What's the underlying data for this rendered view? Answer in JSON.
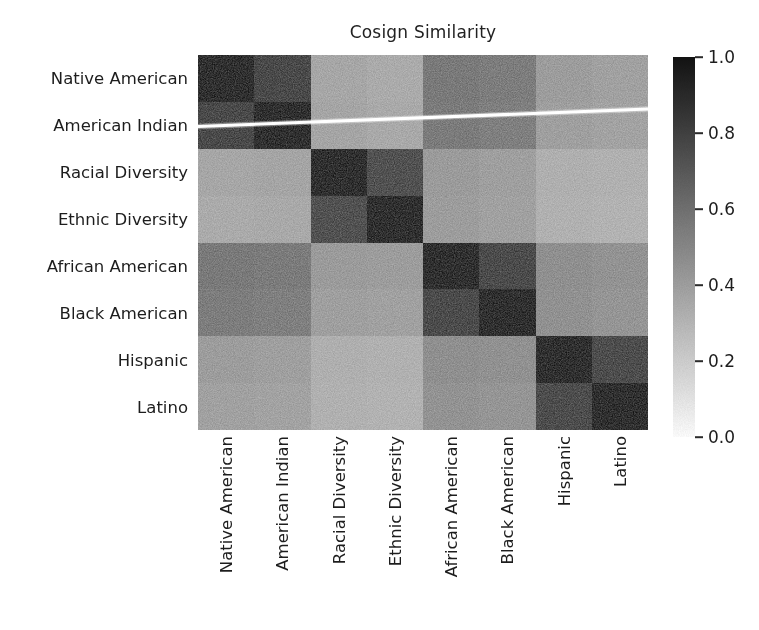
{
  "chart_data": {
    "type": "heatmap",
    "title": "Cosign Similarity",
    "xlabel": "",
    "ylabel": "",
    "grid": false,
    "colormap": "gray_r",
    "vmin": 0.0,
    "vmax": 1.0,
    "categories": [
      "Native American",
      "American Indian",
      "Racial Diversity",
      "Ethnic Diversity",
      "African American",
      "Black American",
      "Hispanic",
      "Latino"
    ],
    "x_tick_labels": [
      "Native American",
      "American Indian",
      "Racial Diversity",
      "Ethnic Diversity",
      "African American",
      "Black American",
      "Hispanic",
      "Latino"
    ],
    "y_tick_labels": [
      "Native American",
      "American Indian",
      "Racial Diversity",
      "Ethnic Diversity",
      "African American",
      "Black American",
      "Hispanic",
      "Latino"
    ],
    "values": [
      [
        1.0,
        0.87,
        0.4,
        0.38,
        0.63,
        0.61,
        0.45,
        0.43
      ],
      [
        0.87,
        1.0,
        0.41,
        0.39,
        0.62,
        0.6,
        0.44,
        0.42
      ],
      [
        0.4,
        0.41,
        1.0,
        0.83,
        0.46,
        0.44,
        0.36,
        0.35
      ],
      [
        0.38,
        0.39,
        0.83,
        1.0,
        0.45,
        0.43,
        0.35,
        0.34
      ],
      [
        0.63,
        0.62,
        0.46,
        0.45,
        1.0,
        0.86,
        0.52,
        0.5
      ],
      [
        0.61,
        0.6,
        0.44,
        0.43,
        0.86,
        1.0,
        0.51,
        0.49
      ],
      [
        0.45,
        0.44,
        0.36,
        0.35,
        0.52,
        0.51,
        1.0,
        0.85
      ],
      [
        0.43,
        0.42,
        0.35,
        0.34,
        0.5,
        0.49,
        0.85,
        1.0
      ]
    ],
    "colorbar": {
      "ticks": [
        1.0,
        0.8,
        0.6,
        0.4,
        0.2,
        0.0
      ],
      "tick_labels": [
        "1.0",
        "0.8",
        "0.6",
        "0.4",
        "0.2",
        "0.0"
      ],
      "position": "right",
      "orientation": "vertical"
    },
    "annotations": [
      {
        "name": "scanner-streak",
        "description": "white diagonal scan artifact across rows 1-2",
        "color": "#ffffff"
      }
    ]
  },
  "figure": {
    "background_color": "#ffffff",
    "text_color": "#1d1d1d"
  }
}
